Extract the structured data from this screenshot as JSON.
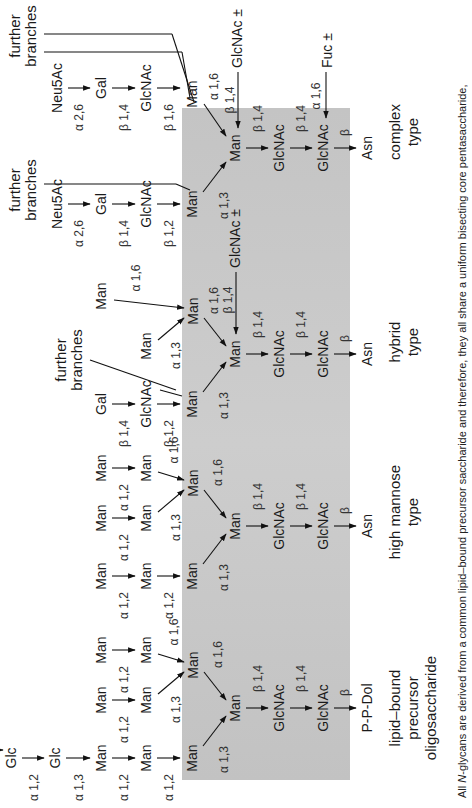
{
  "figure": {
    "background_band_color": "#c8c8c8",
    "caption": {
      "prefix": "All ",
      "italic": "N",
      "text": "-glycans are derived from a common lipid–bound precursor saccharide and therefore, they all share a uniform bisecting core pentasaccharide,"
    },
    "columns": [
      {
        "id": "precursor",
        "label_lines": [
          "lipid–bound",
          "precursor",
          "oligosaccharide"
        ],
        "aglycone": "P-P-Dol",
        "residues": {
          "glc1": "Glc",
          "glc2": "Glc",
          "man_a1": "Man",
          "man_a2": "Man",
          "man_a3": "Man",
          "man_b1": "Man",
          "man_b2": "Man",
          "man_c1": "Man",
          "man_c2": "Man",
          "man_mid": "Man",
          "man_core": "Man",
          "glcnac1": "GlcNAc",
          "glcnac2": "GlcNAc"
        },
        "linkages": {
          "glc_glc": "α 1,2",
          "glc_man": "α 1,3",
          "a1_a2": "α 1,2",
          "a2_a3": "α 1,2",
          "a3_core": "α 1,3",
          "b1_b2": "α 1,2",
          "b2_mid": "α 1,3",
          "c1_c2": "α 1,2",
          "c2_mid": "α 1,6",
          "mid_core": "α 1,6",
          "core_gn": "β 1,4",
          "gn_gn": "β 1,4",
          "gn_dol": "β"
        }
      },
      {
        "id": "high_mannose",
        "label_lines": [
          "high mannose",
          "type"
        ],
        "aglycone": "Asn",
        "residues": {
          "man_a1": "Man",
          "man_a2": "Man",
          "man_a3": "Man",
          "man_b1": "Man",
          "man_b2": "Man",
          "man_c1": "Man",
          "man_c2": "Man",
          "man_mid": "Man",
          "man_core": "Man",
          "glcnac1": "GlcNAc",
          "glcnac2": "GlcNAc"
        },
        "linkages": {
          "a1_a2": "α 1,2",
          "a2_a3": "α 1,2",
          "a3_core": "α 1,3",
          "b1_b2": "α 1,2",
          "b2_mid": "α 1,3",
          "c1_c2": "α 1,2",
          "c2_mid": "α 1,6",
          "mid_core": "α 1,6",
          "core_gn": "β 1,4",
          "gn_gn": "β 1,4",
          "gn_asn": "β"
        }
      },
      {
        "id": "hybrid",
        "label_lines": [
          "hybrid",
          "type"
        ],
        "aglycone": "Asn",
        "further_branches": [
          "further",
          "branches"
        ],
        "bisect": "GlcNAc ±",
        "residues": {
          "gal": "Gal",
          "glcnac_ant": "GlcNAc",
          "man_a": "Man",
          "man_b": "Man",
          "man_c": "Man",
          "man_mid": "Man",
          "man_core": "Man",
          "glcnac1": "GlcNAc",
          "glcnac2": "GlcNAc"
        },
        "linkages": {
          "gal_gn": "β 1,4",
          "gn_man": "β 1,2",
          "a_core": "α 1,3",
          "b_mid": "α 1,3",
          "c_mid": "α 1,6",
          "mid_core": "α 1,6",
          "bisect": "β 1,4",
          "core_gn": "β 1,4",
          "gn_gn": "β 1,4",
          "gn_asn": "β"
        }
      },
      {
        "id": "complex",
        "label_lines": [
          "complex",
          "type"
        ],
        "aglycone": "Asn",
        "further_branches_1": [
          "further",
          "branches"
        ],
        "further_branches_2": [
          "further",
          "branches"
        ],
        "bisect": "GlcNAc ±",
        "fucose": "Fuc ±",
        "residues": {
          "neu_a": "Neu5Ac",
          "gal_a": "Gal",
          "gn_a": "GlcNAc",
          "man_a": "Man",
          "neu_b": "Neu5Ac",
          "gal_b": "Gal",
          "gn_b": "GlcNAc",
          "man_b": "Man",
          "man_core": "Man",
          "glcnac1": "GlcNAc",
          "glcnac2": "GlcNAc"
        },
        "linkages": {
          "neu_gal_a": "α 2,6",
          "gal_gn_a": "β 1,4",
          "gn_man_a": "β 1,2",
          "a_core": "α 1,3",
          "neu_gal_b": "α 2,6",
          "gal_gn_b": "β 1,4",
          "gn_man_b": "β 1,6",
          "b_core": "α 1,6",
          "bisect": "β 1,4",
          "fuc": "α 1,6",
          "core_gn": "β 1,4",
          "gn_gn": "β 1,4",
          "gn_asn": "β"
        }
      }
    ]
  }
}
